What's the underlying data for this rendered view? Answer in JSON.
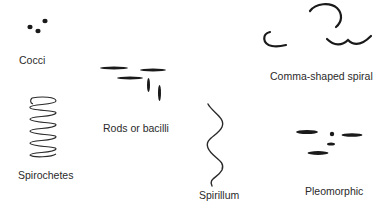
{
  "diagram": {
    "colors": {
      "ink": "#1a1a1a",
      "text": "#2a2a2a",
      "background": "#ffffff"
    },
    "shapes": [
      {
        "id": "cocci",
        "label": "Cocci",
        "icon": "cocci-dots-icon"
      },
      {
        "id": "rods",
        "label": "Rods or bacilli",
        "icon": "rod-bacilli-icon"
      },
      {
        "id": "comma",
        "label": "Comma-shaped spiral",
        "icon": "comma-spiral-icon"
      },
      {
        "id": "spirochetes",
        "label": "Spirochetes",
        "icon": "coil-spring-icon"
      },
      {
        "id": "spirillum",
        "label": "Spirillum",
        "icon": "wavy-spiral-icon"
      },
      {
        "id": "pleomorphic",
        "label": "Pleomorphic",
        "icon": "mixed-shapes-icon"
      }
    ]
  }
}
